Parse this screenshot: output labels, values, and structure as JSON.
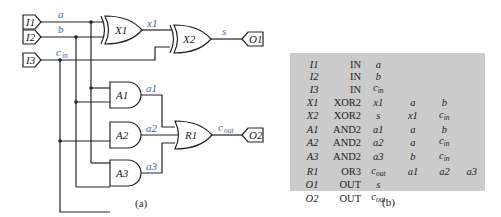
{
  "figure_a": {
    "caption": "(a)",
    "inputs": [
      {
        "id": "I1",
        "net": "a"
      },
      {
        "id": "I2",
        "net": "b"
      },
      {
        "id": "I3",
        "net": "c_in"
      }
    ],
    "gates": [
      {
        "id": "X1",
        "type": "XOR2",
        "output": "x1"
      },
      {
        "id": "X2",
        "type": "XOR2",
        "output": "s"
      },
      {
        "id": "A1",
        "type": "AND2",
        "output": "a1"
      },
      {
        "id": "A2",
        "type": "AND2",
        "output": "a2"
      },
      {
        "id": "A3",
        "type": "AND2",
        "output": "a3"
      },
      {
        "id": "R1",
        "type": "OR3",
        "output": "c_out"
      }
    ],
    "outputs": [
      {
        "id": "O1",
        "net": "s"
      },
      {
        "id": "O2",
        "net": "c_out"
      }
    ],
    "net_labels": {
      "a": "a",
      "b": "b",
      "cin_base": "c",
      "cin_sub": "in",
      "x1": "x1",
      "s": "s",
      "a1": "a1",
      "a2": "a2",
      "a3": "a3",
      "cout_base": "c",
      "cout_sub": "out"
    }
  },
  "figure_b": {
    "caption": "(b)",
    "rows": [
      {
        "name": "I1",
        "type": "IN",
        "out": "a",
        "in1": "",
        "in2": "",
        "in3": ""
      },
      {
        "name": "I2",
        "type": "IN",
        "out": "b",
        "in1": "",
        "in2": "",
        "in3": ""
      },
      {
        "name": "I3",
        "type": "IN",
        "out": "c_in",
        "in1": "",
        "in2": "",
        "in3": ""
      },
      {
        "name": "X1",
        "type": "XOR2",
        "out": "x1",
        "in1": "a",
        "in2": "b",
        "in3": ""
      },
      {
        "name": "X2",
        "type": "XOR2",
        "out": "s",
        "in1": "x1",
        "in2": "c_in",
        "in3": ""
      },
      {
        "name": "A1",
        "type": "AND2",
        "out": "a1",
        "in1": "a",
        "in2": "b",
        "in3": ""
      },
      {
        "name": "A2",
        "type": "AND2",
        "out": "a2",
        "in1": "a",
        "in2": "c_in",
        "in3": ""
      },
      {
        "name": "A3",
        "type": "AND2",
        "out": "a3",
        "in1": "b",
        "in2": "c_in",
        "in3": ""
      },
      {
        "name": "R1",
        "type": "OR3",
        "out": "c_out",
        "in1": "a1",
        "in2": "a2",
        "in3": "a3"
      },
      {
        "name": "O1",
        "type": "OUT",
        "out": "s",
        "in1": "",
        "in2": "",
        "in3": ""
      },
      {
        "name": "O2",
        "type": "OUT",
        "out": "c_out",
        "in1": "",
        "in2": "",
        "in3": ""
      }
    ]
  },
  "colors": {
    "wire": "#222222",
    "net_label": "#3a68b0",
    "table_bg": "#cbcbcb"
  }
}
